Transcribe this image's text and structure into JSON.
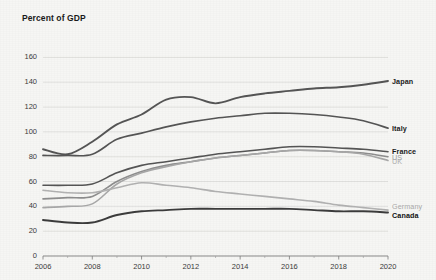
{
  "chart_data": {
    "type": "line",
    "title": "Percent of GDP",
    "xlabel": "",
    "ylabel": "Percent of GDP",
    "xlim": [
      2006,
      2020
    ],
    "ylim": [
      0,
      170
    ],
    "ytick_labels": [
      "0",
      "20",
      "40",
      "60",
      "80",
      "100",
      "120",
      "140",
      "160"
    ],
    "yticks": [
      0,
      20,
      40,
      60,
      80,
      100,
      120,
      140,
      160
    ],
    "xtick_labels": [
      "2006",
      "2008",
      "2010",
      "2012",
      "2014",
      "2016",
      "2018",
      "2020"
    ],
    "xticks": [
      2006,
      2008,
      2010,
      2012,
      2014,
      2016,
      2018,
      2020
    ],
    "grid": "horizontal",
    "legend_position": "right-end-labels",
    "x": [
      2006,
      2007,
      2008,
      2009,
      2010,
      2011,
      2012,
      2013,
      2014,
      2015,
      2016,
      2017,
      2018,
      2019,
      2020
    ],
    "series": [
      {
        "name": "Japan",
        "color": "#555555",
        "width": 1.9,
        "label_color": "#1a1a1a",
        "label_bold": true,
        "values": [
          86,
          82,
          92,
          106,
          114,
          126,
          128,
          123,
          128,
          131,
          133,
          135,
          136,
          138,
          141
        ]
      },
      {
        "name": "Italy",
        "color": "#555555",
        "width": 1.7,
        "label_color": "#1a1a1a",
        "label_bold": true,
        "values": [
          81,
          81,
          82,
          94,
          99,
          104,
          108,
          111,
          113,
          115,
          115,
          114,
          112,
          109,
          103
        ]
      },
      {
        "name": "France",
        "color": "#555555",
        "width": 1.6,
        "label_color": "#1a1a1a",
        "label_bold": true,
        "values": [
          57,
          57,
          58,
          67,
          73,
          76,
          79,
          82,
          84,
          86,
          88,
          88,
          87,
          86,
          84
        ]
      },
      {
        "name": "US",
        "color": "#8e8e8e",
        "width": 1.6,
        "label_color": "#9a9a9a",
        "label_bold": false,
        "values": [
          46,
          47,
          48,
          60,
          68,
          73,
          76,
          79,
          81,
          83,
          85,
          85,
          84,
          83,
          80
        ]
      },
      {
        "name": "UK",
        "color": "#a8a8a8",
        "width": 1.6,
        "label_color": "#adadad",
        "label_bold": false,
        "values": [
          39,
          40,
          42,
          58,
          67,
          72,
          76,
          79,
          81,
          83,
          85,
          85,
          84,
          82,
          77
        ]
      },
      {
        "name": "Germany",
        "color": "#b2b2b2",
        "width": 1.6,
        "label_color": "#a8a8a8",
        "label_bold": false,
        "values": [
          53,
          51,
          51,
          55,
          59,
          57,
          55,
          52,
          50,
          48,
          46,
          44,
          41,
          39,
          37
        ]
      },
      {
        "name": "Canada",
        "color": "#3c3c3c",
        "width": 1.9,
        "label_color": "#111111",
        "label_bold": true,
        "values": [
          29,
          27,
          27,
          33,
          36,
          37,
          38,
          38,
          38,
          38,
          38,
          37,
          36,
          36,
          35
        ]
      }
    ],
    "end_labels": [
      {
        "name": "Japan",
        "y": 141,
        "offset": 0
      },
      {
        "name": "Italy",
        "y": 103,
        "offset": 0
      },
      {
        "name": "France",
        "y": 84,
        "offset": -1
      },
      {
        "name": "US",
        "y": 80,
        "offset": 0
      },
      {
        "name": "UK",
        "y": 77,
        "offset": 1
      },
      {
        "name": "Germany",
        "y": 37,
        "offset": -4
      },
      {
        "name": "Canada",
        "y": 35,
        "offset": 2
      }
    ]
  }
}
